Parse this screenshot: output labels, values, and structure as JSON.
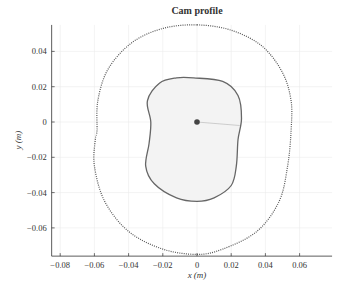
{
  "chart_data": {
    "type": "line",
    "title": "Cam profile",
    "xlabel": "x (m)",
    "ylabel": "y (m)",
    "xlim": [
      -0.085,
      0.079
    ],
    "ylim": [
      -0.076,
      0.055
    ],
    "xticks": [
      -0.08,
      -0.06,
      -0.04,
      -0.02,
      0,
      0.02,
      0.04,
      0.06
    ],
    "xtick_labels": [
      "−0.08",
      "−0.06",
      "−0.04",
      "−0.02",
      "0",
      "0.02",
      "0.04",
      "0.06"
    ],
    "yticks": [
      0.04,
      0.02,
      0,
      -0.02,
      -0.04,
      -0.06
    ],
    "ytick_labels": [
      "0.04",
      "0.02",
      "0",
      "−0.02",
      "−0.04",
      "−0.06"
    ],
    "grid": true,
    "legend": null,
    "series": [
      {
        "name": "pitch curve (outer, dotted)",
        "style": "dotted",
        "points": [
          [
            0.0,
            0.055
          ],
          [
            0.02,
            0.052
          ],
          [
            0.038,
            0.043
          ],
          [
            0.05,
            0.028
          ],
          [
            0.055,
            0.012
          ],
          [
            0.055,
            -0.005
          ],
          [
            0.053,
            -0.025
          ],
          [
            0.048,
            -0.045
          ],
          [
            0.035,
            -0.062
          ],
          [
            0.015,
            -0.072
          ],
          [
            0.0,
            -0.075
          ],
          [
            -0.02,
            -0.072
          ],
          [
            -0.04,
            -0.062
          ],
          [
            -0.054,
            -0.045
          ],
          [
            -0.06,
            -0.025
          ],
          [
            -0.0595,
            -0.01
          ],
          [
            -0.0585,
            -0.005
          ],
          [
            -0.058,
            0.012
          ],
          [
            -0.052,
            0.03
          ],
          [
            -0.038,
            0.045
          ],
          [
            -0.02,
            0.053
          ],
          [
            0.0,
            0.055
          ]
        ]
      },
      {
        "name": "cam profile (inner, solid, shaded)",
        "style": "solid",
        "points": [
          [
            -0.002,
            0.025
          ],
          [
            0.015,
            0.023
          ],
          [
            0.024,
            0.015
          ],
          [
            0.026,
            0.002
          ],
          [
            0.024,
            -0.01
          ],
          [
            0.023,
            -0.025
          ],
          [
            0.02,
            -0.036
          ],
          [
            0.01,
            -0.043
          ],
          [
            0.0,
            -0.045
          ],
          [
            -0.012,
            -0.043
          ],
          [
            -0.025,
            -0.035
          ],
          [
            -0.03,
            -0.025
          ],
          [
            -0.028,
            -0.012
          ],
          [
            -0.027,
            0.0
          ],
          [
            -0.029,
            0.012
          ],
          [
            -0.022,
            0.022
          ],
          [
            -0.012,
            0.025
          ],
          [
            -0.002,
            0.025
          ]
        ]
      }
    ],
    "annotations": [
      {
        "type": "point",
        "label": "cam center",
        "x": 0,
        "y": 0
      },
      {
        "type": "line",
        "label": "reference radius",
        "from": [
          0,
          0
        ],
        "to": [
          0.025,
          -0.002
        ]
      }
    ]
  },
  "colors": {
    "curve": "#555555",
    "fill": "#f3f3f3",
    "grid": "#ebebeb",
    "axis": "#333333",
    "center": "#444444"
  }
}
